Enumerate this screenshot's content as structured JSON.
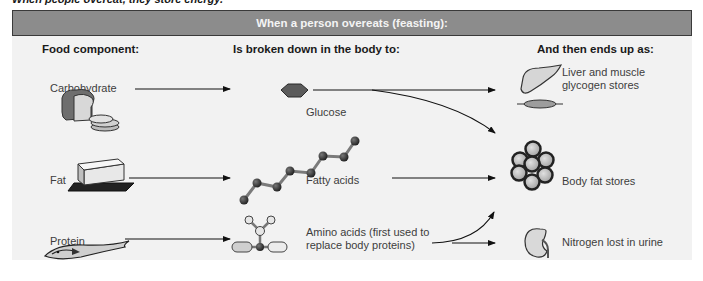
{
  "caption": "When people overeat, they store energy.",
  "header": {
    "title": "When a person overeats (feasting):"
  },
  "columns": {
    "food": "Food component:",
    "breakdown": "Is broken down in the body to:",
    "outcome": "And then ends up as:"
  },
  "rows": [
    {
      "food": "Carbohydrate",
      "food_icon": "bread-icon",
      "product": "Glucose",
      "product_icon": "hexagon-molecule-icon",
      "outcomes": [
        "Liver and muscle glycogen stores",
        "Body fat stores"
      ]
    },
    {
      "food": "Fat",
      "food_icon": "butter-icon",
      "product": "Fatty acids",
      "product_icon": "chain-molecule-icon",
      "outcomes": [
        "Body fat stores"
      ]
    },
    {
      "food": "Protein",
      "food_icon": "fish-icon",
      "product": "Amino acids (first used to replace body proteins)",
      "product_lines": [
        "Amino acids (first used to",
        "replace body proteins)"
      ],
      "product_icon": "amino-acid-molecule-icon",
      "outcomes": [
        "Nitrogen lost in urine",
        "Body fat stores"
      ]
    }
  ],
  "destinations": {
    "glycogen": {
      "lines": [
        "Liver and muscle",
        "glycogen stores"
      ],
      "icon": "liver-muscle-icon"
    },
    "fat": {
      "label": "Body fat stores",
      "icon": "fat-cells-icon"
    },
    "urine": {
      "label": "Nitrogen lost in urine",
      "icon": "kidney-icon"
    }
  }
}
